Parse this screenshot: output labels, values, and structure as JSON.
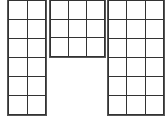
{
  "diagram": {
    "line_color": "#333333",
    "background": "#ffffff",
    "grids": [
      {
        "name": "left-grid",
        "cols": 2,
        "rows": 6,
        "x": 8,
        "y": 0,
        "width": 38,
        "height": 115
      },
      {
        "name": "middle-grid",
        "cols": 3,
        "rows": 3,
        "x": 50,
        "y": 0,
        "width": 55,
        "height": 57
      },
      {
        "name": "right-grid",
        "cols": 3,
        "rows": 6,
        "x": 108,
        "y": 0,
        "width": 56,
        "height": 115
      }
    ]
  }
}
